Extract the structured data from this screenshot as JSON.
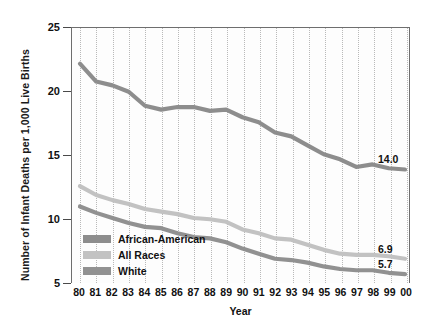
{
  "chart_data": {
    "type": "line",
    "title": "",
    "xlabel": "Year",
    "ylabel": "Number of Infant Deaths per 1,000 Live Births",
    "categories": [
      "80",
      "81",
      "82",
      "83",
      "84",
      "85",
      "86",
      "87",
      "88",
      "89",
      "90",
      "91",
      "92",
      "93",
      "94",
      "95",
      "96",
      "97",
      "98",
      "99",
      "00"
    ],
    "xlim": [
      0,
      20
    ],
    "ylim": [
      5,
      25
    ],
    "yticks": [
      5,
      10,
      15,
      20,
      25
    ],
    "grid": "vertical-dotted",
    "legend_position": "inside-lower-left",
    "series": [
      {
        "name": "African-American",
        "color": "#8d8d8d",
        "values": [
          22.2,
          20.8,
          20.5,
          20.0,
          18.9,
          18.6,
          18.8,
          18.8,
          18.5,
          18.6,
          18.0,
          17.6,
          16.8,
          16.5,
          15.8,
          15.1,
          14.7,
          14.1,
          14.3,
          14.0,
          13.9
        ],
        "end_label": "14.0"
      },
      {
        "name": "All Races",
        "color": "#c2c2c2",
        "values": [
          12.6,
          11.9,
          11.5,
          11.2,
          10.8,
          10.6,
          10.4,
          10.1,
          10.0,
          9.8,
          9.2,
          8.9,
          8.5,
          8.4,
          8.0,
          7.6,
          7.3,
          7.2,
          7.2,
          7.1,
          6.9
        ],
        "end_label": "6.9"
      },
      {
        "name": "White",
        "color": "#919191",
        "values": [
          11.0,
          10.5,
          10.1,
          9.7,
          9.4,
          9.3,
          8.9,
          8.6,
          8.5,
          8.2,
          7.7,
          7.3,
          6.9,
          6.8,
          6.6,
          6.3,
          6.1,
          6.0,
          6.0,
          5.8,
          5.7
        ],
        "end_label": "5.7"
      }
    ]
  },
  "axes": {
    "y_title": "Number of Infant Deaths per 1,000 Live Births",
    "x_title": "Year",
    "y_tick_labels": [
      "25",
      "20",
      "15",
      "10",
      "5"
    ],
    "x_tick_labels": [
      "80",
      "81",
      "82",
      "83",
      "84",
      "85",
      "86",
      "87",
      "88",
      "89",
      "90",
      "91",
      "92",
      "93",
      "94",
      "95",
      "96",
      "97",
      "98",
      "99",
      "00"
    ]
  },
  "legend": {
    "items": [
      {
        "label": "African-American",
        "color": "#8d8d8d"
      },
      {
        "label": "All Races",
        "color": "#c2c2c2"
      },
      {
        "label": "White",
        "color": "#919191"
      }
    ]
  },
  "end_labels": [
    {
      "text": "14.0"
    },
    {
      "text": "6.9"
    },
    {
      "text": "5.7"
    }
  ]
}
